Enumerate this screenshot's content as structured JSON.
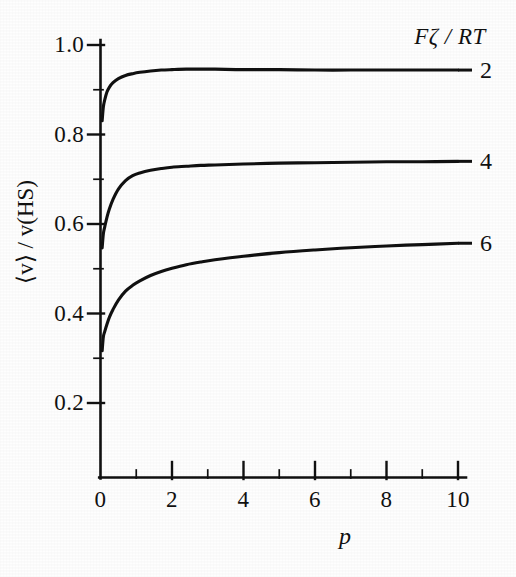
{
  "chart_data": {
    "type": "line",
    "title": "",
    "xlabel": "p",
    "ylabel": "⟨v⟩ / v(HS)",
    "xlim": [
      0,
      10.4
    ],
    "ylim": [
      0,
      1.06
    ],
    "grid": false,
    "legend_position": "right-of-curves",
    "legend_title": "Fζ / RT",
    "x_ticks": [
      0,
      2,
      4,
      6,
      8,
      10
    ],
    "x_tick_labels": [
      "0",
      "2",
      "4",
      "6",
      "8",
      "10"
    ],
    "x_minor_ticks": [
      1,
      3,
      5,
      7,
      9
    ],
    "y_ticks": [
      0.2,
      0.4,
      0.6,
      0.8,
      1.0
    ],
    "y_tick_labels": [
      "0.2",
      "0.4",
      "0.6",
      "0.8",
      "1.0"
    ],
    "y_minor_ticks": [
      0.3,
      0.5,
      0.7,
      0.9
    ],
    "series": [
      {
        "name": "2",
        "label": "2",
        "color": "#111111",
        "x": [
          0.08,
          0.12,
          0.18,
          0.25,
          0.35,
          0.5,
          0.7,
          0.9,
          1.1,
          1.4,
          1.7,
          2.0,
          2.4,
          2.8,
          3.2,
          4.0,
          5.0,
          6.0,
          7.0,
          8.0,
          9.0,
          10.0
        ],
        "y": [
          0.862,
          0.878,
          0.895,
          0.906,
          0.916,
          0.925,
          0.932,
          0.936,
          0.939,
          0.942,
          0.944,
          0.945,
          0.946,
          0.946,
          0.946,
          0.945,
          0.945,
          0.944,
          0.944,
          0.944,
          0.944,
          0.944
        ]
      },
      {
        "name": "4",
        "label": "4",
        "color": "#111111",
        "x": [
          0.08,
          0.12,
          0.18,
          0.25,
          0.35,
          0.5,
          0.7,
          0.9,
          1.1,
          1.4,
          1.7,
          2.0,
          2.4,
          2.8,
          3.2,
          4.0,
          5.0,
          6.0,
          7.0,
          8.0,
          9.0,
          10.0
        ],
        "y": [
          0.578,
          0.594,
          0.615,
          0.634,
          0.655,
          0.678,
          0.697,
          0.708,
          0.714,
          0.72,
          0.724,
          0.727,
          0.729,
          0.731,
          0.732,
          0.734,
          0.736,
          0.737,
          0.738,
          0.739,
          0.739,
          0.74
        ]
      },
      {
        "name": "6",
        "label": "6",
        "color": "#111111",
        "x": [
          0.08,
          0.12,
          0.18,
          0.25,
          0.35,
          0.5,
          0.7,
          0.9,
          1.1,
          1.4,
          1.7,
          2.0,
          2.4,
          2.8,
          3.2,
          4.0,
          5.0,
          6.0,
          7.0,
          8.0,
          9.0,
          10.0
        ],
        "y": [
          0.348,
          0.36,
          0.376,
          0.392,
          0.409,
          0.43,
          0.45,
          0.463,
          0.473,
          0.485,
          0.494,
          0.501,
          0.509,
          0.515,
          0.52,
          0.528,
          0.536,
          0.542,
          0.547,
          0.551,
          0.554,
          0.557
        ]
      }
    ]
  },
  "axes": {
    "y_label": "⟨v⟩ / v(HS)",
    "x_label": "p"
  },
  "legend": {
    "title": "Fζ / RT",
    "entries": [
      {
        "label": "2"
      },
      {
        "label": "4"
      },
      {
        "label": "6"
      }
    ]
  },
  "colors": {
    "ink": "#111111",
    "background": "#fefefe"
  }
}
